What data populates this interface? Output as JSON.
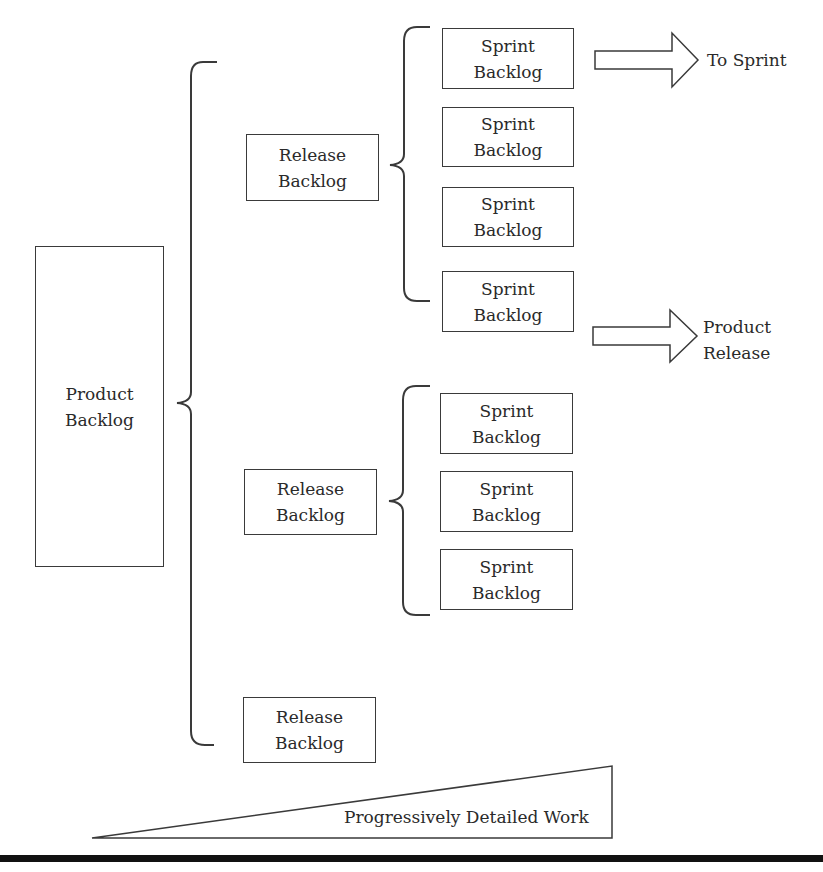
{
  "diagram": {
    "product_backlog": {
      "line1": "Product",
      "line2": "Backlog"
    },
    "release_backlogs": [
      {
        "line1": "Release",
        "line2": "Backlog"
      },
      {
        "line1": "Release",
        "line2": "Backlog"
      },
      {
        "line1": "Release",
        "line2": "Backlog"
      }
    ],
    "sprint_backlogs_group1": [
      {
        "line1": "Sprint",
        "line2": "Backlog"
      },
      {
        "line1": "Sprint",
        "line2": "Backlog"
      },
      {
        "line1": "Sprint",
        "line2": "Backlog"
      },
      {
        "line1": "Sprint",
        "line2": "Backlog"
      }
    ],
    "sprint_backlogs_group2": [
      {
        "line1": "Sprint",
        "line2": "Backlog"
      },
      {
        "line1": "Sprint",
        "line2": "Backlog"
      },
      {
        "line1": "Sprint",
        "line2": "Backlog"
      }
    ],
    "arrows": {
      "to_sprint": {
        "label": "To Sprint"
      },
      "product_release": {
        "line1": "Product",
        "line2": "Release"
      }
    },
    "wedge": {
      "label": "Progressively Detailed Work"
    },
    "colors": {
      "stroke": "#3a3a3a",
      "text": "#2a2a2a",
      "bar": "#111111",
      "background": "#ffffff"
    }
  }
}
